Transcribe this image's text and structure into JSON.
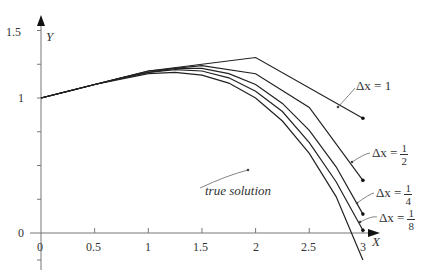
{
  "chart_data": {
    "type": "line",
    "title": "",
    "xlabel": "X",
    "ylabel": "Y",
    "xlim": [
      0,
      3.05
    ],
    "ylim": [
      -0.25,
      1.6
    ],
    "x_ticks": [
      "0",
      "0.5",
      "1",
      "1.5",
      "2",
      "2.5",
      "3"
    ],
    "y_ticks": [
      "0",
      "1",
      "1.5"
    ],
    "grid": false,
    "series": [
      {
        "name": "Δx = 1",
        "x": [
          0,
          1,
          2,
          3
        ],
        "y": [
          1,
          1.2,
          1.3,
          0.85
        ]
      },
      {
        "name": "Δx = 1/2",
        "x": [
          0,
          0.5,
          1,
          1.5,
          2,
          2.5,
          3
        ],
        "y": [
          1,
          1.1,
          1.2,
          1.24,
          1.18,
          0.93,
          0.39
        ]
      },
      {
        "name": "Δx = 1/4",
        "x": [
          0,
          0.25,
          0.5,
          0.75,
          1,
          1.25,
          1.5,
          1.75,
          2,
          2.25,
          2.5,
          2.75,
          3
        ],
        "y": [
          1,
          1.05,
          1.1,
          1.15,
          1.19,
          1.22,
          1.22,
          1.18,
          1.1,
          0.96,
          0.76,
          0.49,
          0.14
        ]
      },
      {
        "name": "Δx = 1/8",
        "x": [
          0,
          0.5,
          1,
          1.25,
          1.5,
          1.75,
          2,
          2.25,
          2.5,
          2.75,
          3
        ],
        "y": [
          1,
          1.1,
          1.19,
          1.21,
          1.2,
          1.15,
          1.05,
          0.9,
          0.67,
          0.38,
          0.02
        ]
      },
      {
        "name": "true solution",
        "x": [
          0,
          0.5,
          1,
          1.25,
          1.5,
          1.75,
          2,
          2.25,
          2.5,
          2.75,
          3
        ],
        "y": [
          1,
          1.1,
          1.18,
          1.19,
          1.17,
          1.11,
          1.0,
          0.83,
          0.59,
          0.27,
          -0.2
        ]
      }
    ],
    "annotations": [
      "Δx = 1",
      "Δx = 1/2",
      "Δx = 1/4",
      "Δx = 1/8",
      "true solution"
    ]
  },
  "labels": {
    "x_axis": "X",
    "y_axis": "Y",
    "dx": "Δx =",
    "one": "1",
    "half_num": "1",
    "half_den": "2",
    "quarter_num": "1",
    "quarter_den": "4",
    "eighth_num": "1",
    "eighth_den": "8",
    "true_solution": "true solution"
  }
}
